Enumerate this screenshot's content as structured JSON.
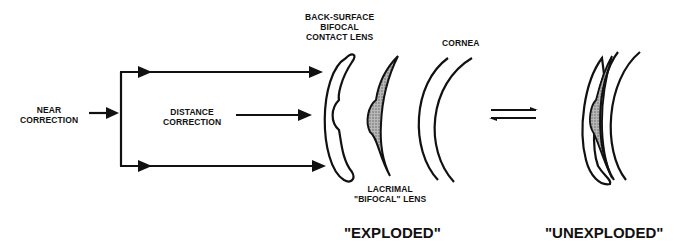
{
  "diagram": {
    "type": "optics-schematic",
    "labels": {
      "near_correction": [
        "NEAR",
        "CORRECTION"
      ],
      "distance_correction": [
        "DISTANCE",
        "CORRECTION"
      ],
      "contact_lens": [
        "BACK-SURFACE",
        "BIFOCAL",
        "CONTACT LENS"
      ],
      "cornea": "CORNEA",
      "lacrimal_lens": [
        "LACRIMAL",
        "\"BIFOCAL\" LENS"
      ],
      "exploded": "\"EXPLODED\"",
      "unexploded": "\"UNEXPLODED\""
    },
    "symbols": {
      "equilibrium": "double-arrow-icon"
    },
    "colors": {
      "ink": "#111111",
      "shading": "#8a8a8a",
      "background": "#ffffff"
    }
  }
}
